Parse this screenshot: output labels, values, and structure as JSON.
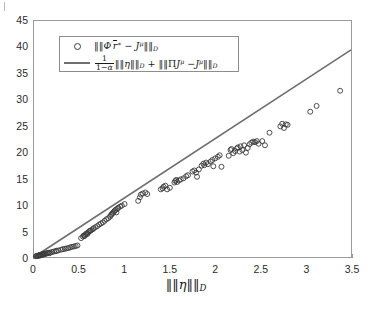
{
  "figure": {
    "background": "#ffffff",
    "axis_color": "#9a9a9a",
    "marker_color": "#3a3a3a",
    "line_color": "#6e6e6e"
  },
  "axes": {
    "xlabel_parts": {
      "bars_open": "‖",
      "eta": "η",
      "bars_close": "‖",
      "sub": "D"
    },
    "x_ticks": [
      "0",
      "0.5",
      "1",
      "1.5",
      "2",
      "2.5",
      "3",
      "3.5"
    ],
    "y_ticks": [
      "0",
      "5",
      "10",
      "15",
      "20",
      "25",
      "30",
      "35",
      "40",
      "45"
    ]
  },
  "legend": {
    "entry1": {
      "marker": "circle-marker",
      "norm_open": "‖",
      "phi": "Φ",
      "prime": "′",
      "r": "r",
      "star": "∗",
      "minus": "−",
      "J": "J",
      "mu": "μ",
      "norm_close": "‖",
      "sub": "D"
    },
    "entry2": {
      "marker": "line-sample",
      "frac_num": "1",
      "frac_den_one": "1",
      "frac_den_minus": "−",
      "frac_den_alpha": "α",
      "norm_open": "‖",
      "eta": "η",
      "norm_close": "‖",
      "sub": "D",
      "plus": "+",
      "norm2_open": "‖",
      "Pi": "Π",
      "J": "J",
      "mu": "μ",
      "minus": "−",
      "J2": "J",
      "mu2": "μ",
      "norm2_close": "‖",
      "sub2": "D"
    }
  },
  "chart_data": {
    "type": "scatter",
    "title": "",
    "xlabel": "||η||_D",
    "ylabel": "",
    "xlim": [
      0,
      3.5
    ],
    "ylim": [
      0,
      45
    ],
    "xticks": [
      0,
      0.5,
      1,
      1.5,
      2,
      2.5,
      3,
      3.5
    ],
    "yticks": [
      0,
      5,
      10,
      15,
      20,
      25,
      30,
      35,
      40,
      45
    ],
    "grid": false,
    "legend_position": "upper left",
    "series": [
      {
        "name": "||Φ'r* - J^μ||_D",
        "type": "scatter",
        "marker": "o",
        "filled": false,
        "color": "#3a3a3a",
        "points": [
          [
            0.02,
            0.15
          ],
          [
            0.03,
            0.22
          ],
          [
            0.04,
            0.18
          ],
          [
            0.05,
            0.3
          ],
          [
            0.05,
            0.25
          ],
          [
            0.06,
            0.35
          ],
          [
            0.07,
            0.4
          ],
          [
            0.07,
            0.28
          ],
          [
            0.08,
            0.45
          ],
          [
            0.09,
            0.5
          ],
          [
            0.1,
            0.55
          ],
          [
            0.1,
            0.42
          ],
          [
            0.11,
            0.6
          ],
          [
            0.12,
            0.65
          ],
          [
            0.13,
            0.58
          ],
          [
            0.14,
            0.7
          ],
          [
            0.15,
            0.75
          ],
          [
            0.16,
            0.8
          ],
          [
            0.17,
            0.72
          ],
          [
            0.18,
            0.85
          ],
          [
            0.2,
            0.95
          ],
          [
            0.22,
            1.05
          ],
          [
            0.24,
            1.1
          ],
          [
            0.25,
            1.2
          ],
          [
            0.27,
            1.25
          ],
          [
            0.3,
            1.4
          ],
          [
            0.32,
            1.5
          ],
          [
            0.34,
            1.55
          ],
          [
            0.36,
            1.65
          ],
          [
            0.38,
            1.7
          ],
          [
            0.4,
            1.85
          ],
          [
            0.42,
            1.95
          ],
          [
            0.44,
            2.0
          ],
          [
            0.46,
            2.1
          ],
          [
            0.48,
            2.2
          ],
          [
            0.52,
            3.6
          ],
          [
            0.54,
            3.9
          ],
          [
            0.55,
            4.1
          ],
          [
            0.56,
            4.0
          ],
          [
            0.57,
            4.3
          ],
          [
            0.58,
            4.5
          ],
          [
            0.59,
            4.4
          ],
          [
            0.6,
            4.7
          ],
          [
            0.61,
            4.9
          ],
          [
            0.62,
            5.0
          ],
          [
            0.63,
            5.1
          ],
          [
            0.65,
            5.3
          ],
          [
            0.66,
            5.5
          ],
          [
            0.68,
            5.7
          ],
          [
            0.7,
            5.9
          ],
          [
            0.72,
            6.2
          ],
          [
            0.74,
            6.4
          ],
          [
            0.76,
            6.6
          ],
          [
            0.78,
            6.9
          ],
          [
            0.8,
            7.2
          ],
          [
            0.82,
            7.4
          ],
          [
            0.84,
            7.7
          ],
          [
            0.85,
            8.0
          ],
          [
            0.86,
            8.2
          ],
          [
            0.87,
            8.4
          ],
          [
            0.88,
            8.6
          ],
          [
            0.89,
            8.8
          ],
          [
            0.9,
            9.0
          ],
          [
            0.91,
            8.5
          ],
          [
            0.92,
            9.2
          ],
          [
            0.93,
            9.4
          ],
          [
            0.95,
            9.6
          ],
          [
            0.97,
            9.8
          ],
          [
            1.0,
            10.1
          ],
          [
            1.15,
            10.7
          ],
          [
            1.17,
            11.4
          ],
          [
            1.18,
            11.9
          ],
          [
            1.2,
            12.1
          ],
          [
            1.23,
            12.3
          ],
          [
            1.25,
            12.0
          ],
          [
            1.4,
            12.9
          ],
          [
            1.42,
            13.1
          ],
          [
            1.43,
            13.4
          ],
          [
            1.45,
            13.6
          ],
          [
            1.47,
            12.9
          ],
          [
            1.5,
            13.2
          ],
          [
            1.55,
            14.2
          ],
          [
            1.56,
            14.5
          ],
          [
            1.57,
            14.7
          ],
          [
            1.58,
            14.3
          ],
          [
            1.6,
            14.6
          ],
          [
            1.62,
            14.8
          ],
          [
            1.65,
            15.0
          ],
          [
            1.68,
            15.4
          ],
          [
            1.7,
            15.6
          ],
          [
            1.75,
            16.3
          ],
          [
            1.77,
            16.5
          ],
          [
            1.79,
            16.1
          ],
          [
            1.8,
            15.3
          ],
          [
            1.82,
            16.7
          ],
          [
            1.85,
            17.4
          ],
          [
            1.87,
            17.8
          ],
          [
            1.88,
            17.5
          ],
          [
            1.9,
            18.0
          ],
          [
            1.92,
            17.7
          ],
          [
            1.95,
            18.2
          ],
          [
            1.97,
            18.5
          ],
          [
            1.98,
            17.3
          ],
          [
            2.0,
            18.8
          ],
          [
            2.03,
            19.1
          ],
          [
            2.05,
            19.4
          ],
          [
            2.07,
            17.2
          ],
          [
            2.15,
            19.3
          ],
          [
            2.17,
            20.4
          ],
          [
            2.18,
            20.6
          ],
          [
            2.2,
            19.8
          ],
          [
            2.22,
            20.2
          ],
          [
            2.24,
            20.7
          ],
          [
            2.25,
            20.9
          ],
          [
            2.27,
            20.1
          ],
          [
            2.28,
            21.1
          ],
          [
            2.3,
            20.4
          ],
          [
            2.32,
            21.3
          ],
          [
            2.34,
            19.9
          ],
          [
            2.36,
            20.8
          ],
          [
            2.38,
            21.5
          ],
          [
            2.4,
            21.8
          ],
          [
            2.42,
            22.0
          ],
          [
            2.44,
            21.9
          ],
          [
            2.46,
            22.1
          ],
          [
            2.48,
            21.6
          ],
          [
            2.52,
            22.1
          ],
          [
            2.55,
            21.3
          ],
          [
            2.6,
            23.7
          ],
          [
            2.72,
            24.9
          ],
          [
            2.74,
            25.4
          ],
          [
            2.76,
            24.6
          ],
          [
            2.78,
            25.3
          ],
          [
            2.8,
            25.2
          ],
          [
            3.05,
            27.7
          ],
          [
            3.12,
            28.8
          ],
          [
            3.38,
            31.7
          ]
        ]
      },
      {
        "name": "1/(1-α)||η||_D + ||ΠJ^μ - J^μ||_D",
        "type": "line",
        "color": "#6e6e6e",
        "x": [
          0,
          3.5
        ],
        "y": [
          0,
          39.5
        ],
        "slope": 11.29
      }
    ]
  }
}
